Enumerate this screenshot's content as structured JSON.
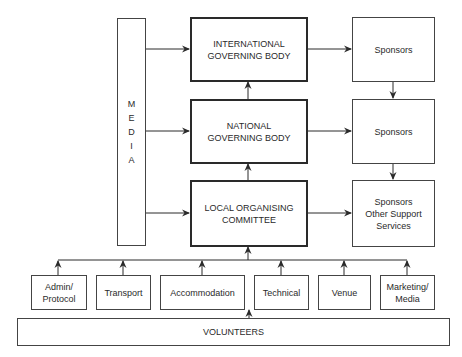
{
  "diagram": {
    "media": {
      "letters": [
        "M",
        "E",
        "D",
        "I",
        "A"
      ]
    },
    "governing": [
      {
        "id": "international",
        "label": "INTERNATIONAL\nGOVERNING BODY"
      },
      {
        "id": "national",
        "label": "NATIONAL\nGOVERNING BODY"
      },
      {
        "id": "local",
        "label": "LOCAL ORGANISING\nCOMMITTEE"
      }
    ],
    "sponsors": [
      {
        "id": "sponsors-1",
        "label": "Sponsors"
      },
      {
        "id": "sponsors-2",
        "label": "Sponsors"
      },
      {
        "id": "sponsors-3",
        "label": "Sponsors\nOther Support\nServices"
      }
    ],
    "functions": [
      {
        "id": "admin",
        "label": "Admin/\nProtocol"
      },
      {
        "id": "transport",
        "label": "Transport"
      },
      {
        "id": "accommodation",
        "label": "Accommodation"
      },
      {
        "id": "technical",
        "label": "Technical"
      },
      {
        "id": "venue",
        "label": "Venue"
      },
      {
        "id": "marketing",
        "label": "Marketing/\nMedia"
      }
    ],
    "volunteers": {
      "label": "VOLUNTEERS"
    },
    "colors": {
      "line": "#2a2a2a",
      "border": "#444444",
      "background": "#ffffff"
    }
  }
}
